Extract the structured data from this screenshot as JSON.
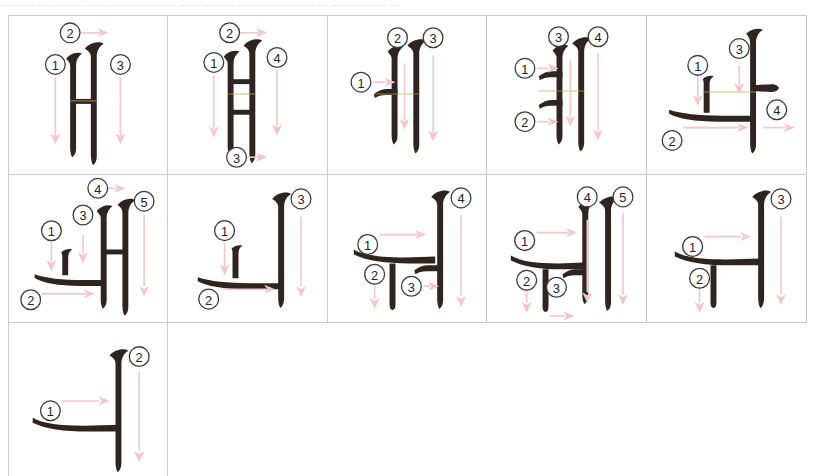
{
  "page": {
    "top_caption": "― ―― ― ―――  ―― ― ―――― ― ――  ――― ― ―― ―――― ― ――― ―― ―",
    "ink_color": "#2f2520",
    "arrow_color": "#f0c8cc",
    "grid_line_color": "#c9c9c9",
    "background": "#ffffff"
  },
  "grid": {
    "columns": 5,
    "rows": 3,
    "cells": [
      {
        "index": 1,
        "row": 1,
        "column": 1,
        "character": "ㅐ",
        "romanization": "yae",
        "stroke_count": 3,
        "strokes": [
          {
            "number": "1",
            "direction": "down"
          },
          {
            "number": "2",
            "direction": "right"
          },
          {
            "number": "3",
            "direction": "down"
          }
        ]
      },
      {
        "index": 2,
        "row": 1,
        "column": 2,
        "character": "ㅒ",
        "romanization": "yae",
        "stroke_count": 4,
        "strokes": [
          {
            "number": "1",
            "direction": "down"
          },
          {
            "number": "2",
            "direction": "right"
          },
          {
            "number": "3",
            "direction": "right"
          },
          {
            "number": "4",
            "direction": "down"
          }
        ]
      },
      {
        "index": 3,
        "row": 1,
        "column": 3,
        "character": "ㅔ",
        "romanization": "e",
        "stroke_count": 3,
        "strokes": [
          {
            "number": "1",
            "direction": "right"
          },
          {
            "number": "2",
            "direction": "down"
          },
          {
            "number": "3",
            "direction": "down"
          }
        ]
      },
      {
        "index": 4,
        "row": 1,
        "column": 4,
        "character": "ㅖ",
        "romanization": "ye",
        "stroke_count": 4,
        "strokes": [
          {
            "number": "1",
            "direction": "right"
          },
          {
            "number": "2",
            "direction": "right"
          },
          {
            "number": "3",
            "direction": "down"
          },
          {
            "number": "4",
            "direction": "down"
          }
        ]
      },
      {
        "index": 5,
        "row": 1,
        "column": 5,
        "character": "ㅘ",
        "romanization": "wa",
        "stroke_count": 4,
        "strokes": [
          {
            "number": "1",
            "direction": "down"
          },
          {
            "number": "2",
            "direction": "right"
          },
          {
            "number": "3",
            "direction": "down"
          },
          {
            "number": "4",
            "direction": "right"
          }
        ]
      },
      {
        "index": 6,
        "row": 2,
        "column": 1,
        "character": "ㅙ",
        "romanization": "wae",
        "stroke_count": 5,
        "strokes": [
          {
            "number": "1",
            "direction": "down"
          },
          {
            "number": "2",
            "direction": "right"
          },
          {
            "number": "3",
            "direction": "down"
          },
          {
            "number": "4",
            "direction": "right"
          },
          {
            "number": "5",
            "direction": "down"
          }
        ]
      },
      {
        "index": 7,
        "row": 2,
        "column": 2,
        "character": "ㅚ",
        "romanization": "oe",
        "stroke_count": 3,
        "strokes": [
          {
            "number": "1",
            "direction": "down"
          },
          {
            "number": "2",
            "direction": "right"
          },
          {
            "number": "3",
            "direction": "down"
          }
        ]
      },
      {
        "index": 8,
        "row": 2,
        "column": 3,
        "character": "ㅝ",
        "romanization": "wo",
        "stroke_count": 4,
        "strokes": [
          {
            "number": "1",
            "direction": "right"
          },
          {
            "number": "2",
            "direction": "down"
          },
          {
            "number": "3",
            "direction": "right"
          },
          {
            "number": "4",
            "direction": "down"
          }
        ]
      },
      {
        "index": 9,
        "row": 2,
        "column": 4,
        "character": "ㅞ",
        "romanization": "we",
        "stroke_count": 5,
        "strokes": [
          {
            "number": "1",
            "direction": "right"
          },
          {
            "number": "2",
            "direction": "down"
          },
          {
            "number": "3",
            "direction": "right"
          },
          {
            "number": "4",
            "direction": "down"
          },
          {
            "number": "5",
            "direction": "down"
          }
        ]
      },
      {
        "index": 10,
        "row": 2,
        "column": 5,
        "character": "ㅟ",
        "romanization": "wi",
        "stroke_count": 3,
        "strokes": [
          {
            "number": "1",
            "direction": "right"
          },
          {
            "number": "2",
            "direction": "down"
          },
          {
            "number": "3",
            "direction": "down"
          }
        ]
      },
      {
        "index": 11,
        "row": 3,
        "column": 1,
        "character": "ㅢ",
        "romanization": "ui",
        "stroke_count": 2,
        "strokes": [
          {
            "number": "1",
            "direction": "right"
          },
          {
            "number": "2",
            "direction": "down"
          }
        ]
      }
    ]
  }
}
